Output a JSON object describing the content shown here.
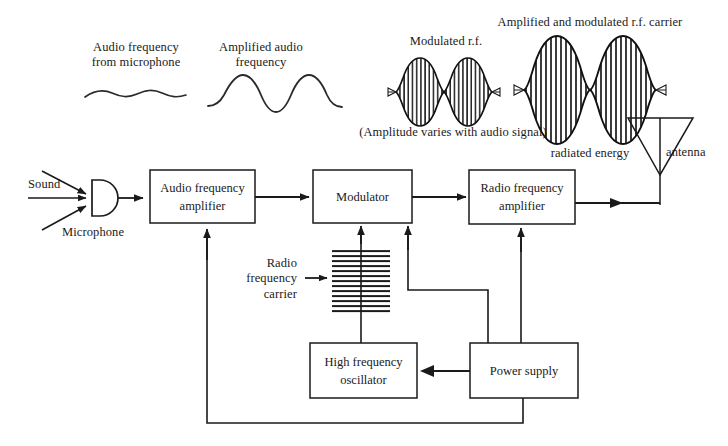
{
  "figure": {
    "stroke_color": "#1a1a1a",
    "background_color": "#ffffff"
  },
  "captions": {
    "audio_from_mic": "Audio frequency\nfrom microphone",
    "amplified_audio": "Amplified audio\nfrequency",
    "modulated_rf": "Modulated r.f.",
    "amplitude_note": "(Amplitude varies with audio signal)",
    "amplified_modulated_carrier": "Amplified and modulated r.f. carrier",
    "radiated_energy": "radiated energy",
    "antenna": "antenna"
  },
  "inputs": {
    "sound": "Sound",
    "microphone": "Microphone",
    "rf_carrier": "Radio\nfrequency\ncarrier"
  },
  "blocks": [
    {
      "id": "audio-frequency-amplifier",
      "label": "Audio frequency\namplifier",
      "x": 150,
      "y": 170,
      "w": 105,
      "h": 53
    },
    {
      "id": "modulator",
      "label": "Modulator",
      "x": 313,
      "y": 170,
      "w": 99,
      "h": 53
    },
    {
      "id": "radio-frequency-amplifier",
      "label": "Radio frequency\namplifier",
      "x": 469,
      "y": 170,
      "w": 106,
      "h": 54
    },
    {
      "id": "high-frequency-oscillator",
      "label": "High frequency\noscillator",
      "x": 310,
      "y": 343,
      "w": 107,
      "h": 55
    },
    {
      "id": "power-supply",
      "label": "Power supply",
      "x": 470,
      "y": 343,
      "w": 108,
      "h": 55
    }
  ],
  "waveforms": {
    "audio_low": {
      "label": "low amplitude audio sine wave",
      "amplitude": 4,
      "cycles": 3
    },
    "audio_high": {
      "label": "high amplitude audio sine wave",
      "amplitude": 16,
      "cycles": 2
    },
    "modulated_small": {
      "label": "modulated r.f. envelope, two lobes",
      "lobes": 2,
      "peak": 26
    },
    "modulated_large": {
      "label": "amplified modulated r.f. envelope, two lobes",
      "lobes": 2,
      "peak": 50
    },
    "rf_carrier_block": {
      "label": "dense horizontal line hatch representing r.f. carrier",
      "lines": 26
    }
  },
  "connections": [
    {
      "from": "microphone",
      "to": "audio-frequency-amplifier",
      "type": "arrow"
    },
    {
      "from": "audio-frequency-amplifier",
      "to": "modulator",
      "type": "arrow"
    },
    {
      "from": "modulator",
      "to": "radio-frequency-amplifier",
      "type": "arrow"
    },
    {
      "from": "radio-frequency-amplifier",
      "to": "antenna",
      "type": "arrow"
    },
    {
      "from": "rf-carrier",
      "to": "modulator",
      "type": "arrow"
    },
    {
      "from": "high-frequency-oscillator",
      "to": "rf-carrier",
      "type": "line"
    },
    {
      "from": "power-supply",
      "to": "high-frequency-oscillator",
      "type": "arrow"
    },
    {
      "from": "power-supply",
      "to": "modulator",
      "type": "arrow"
    },
    {
      "from": "power-supply",
      "to": "radio-frequency-amplifier",
      "type": "arrow"
    },
    {
      "from": "power-supply",
      "to": "audio-frequency-amplifier",
      "type": "arrow"
    }
  ]
}
